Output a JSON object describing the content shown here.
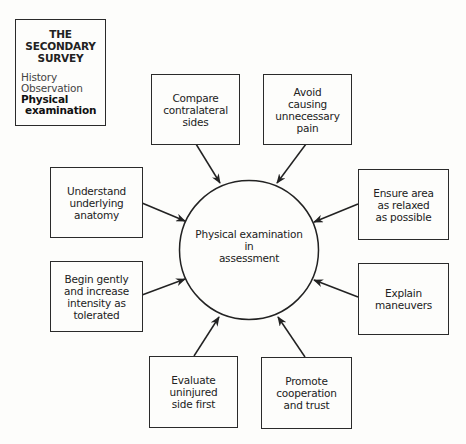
{
  "title_box": {
    "heading": "THE\nSECONDARY\nSURVEY",
    "items": [
      {
        "label": "History",
        "emphasis": false
      },
      {
        "label": "Observation",
        "emphasis": false
      },
      {
        "label": "Physical",
        "emphasis": true
      },
      {
        "label": "examination",
        "emphasis": true
      }
    ]
  },
  "center": {
    "label": "Physical examination\nin\nassessment"
  },
  "nodes": [
    {
      "id": "compare",
      "label": "Compare\ncontralateral\nsides"
    },
    {
      "id": "avoid",
      "label": "Avoid\ncausing\nunnecessary\npain"
    },
    {
      "id": "understand",
      "label": "Understand\nunderlying\nanatomy"
    },
    {
      "id": "ensure",
      "label": "Ensure area\nas relaxed\nas possible"
    },
    {
      "id": "begin",
      "label": "Begin gently\nand increase\nintensity as\ntolerated"
    },
    {
      "id": "explain",
      "label": "Explain\nmaneuvers"
    },
    {
      "id": "evaluate",
      "label": "Evaluate\nuninjured\nside first"
    },
    {
      "id": "promote",
      "label": "Promote\ncooperation\nand trust"
    }
  ],
  "colors": {
    "line": "#222222",
    "background": "#fdfdfb"
  }
}
